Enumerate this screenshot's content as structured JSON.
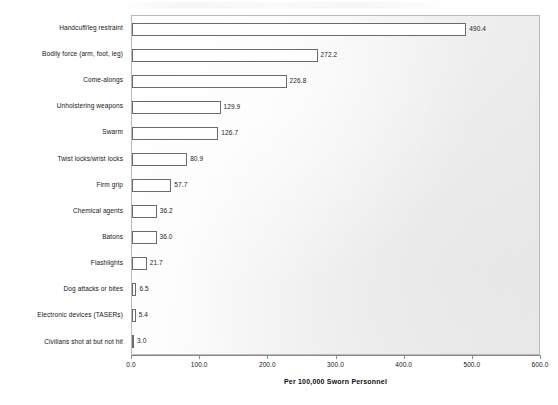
{
  "chart_data": {
    "type": "bar",
    "orientation": "horizontal",
    "title": "",
    "xlabel": "Per 100,000 Sworn Personnel",
    "ylabel": "",
    "xlim": [
      0.0,
      600.0
    ],
    "xticks": [
      "0.0",
      "100.0",
      "200.0",
      "300.0",
      "400.0",
      "500.0",
      "600.0"
    ],
    "xtick_values": [
      0,
      100,
      200,
      300,
      400,
      500,
      600
    ],
    "grid": false,
    "legend": null,
    "categories": [
      "Handcuff/leg restraint",
      "Bodily force (arm, foot, leg)",
      "Come-alongs",
      "Unholstering weapons",
      "Swarm",
      "Twist locks/wrist locks",
      "Firm grip",
      "Chemical agents",
      "Batons",
      "Flashlights",
      "Dog attacks or bites",
      "Electronic devices (TASERs)",
      "Civilians shot at but not hit"
    ],
    "values": [
      490.4,
      272.2,
      226.8,
      129.9,
      126.7,
      80.9,
      57.7,
      36.2,
      36.0,
      21.7,
      6.5,
      5.4,
      3.0
    ],
    "value_labels": [
      "490.4",
      "272.2",
      "226.8",
      "129.9",
      "126.7",
      "80.9",
      "57.7",
      "36.2",
      "36.0",
      "21.7",
      "6.5",
      "5.4",
      "3.0"
    ],
    "bar_fill_color": "#ffffff",
    "bar_edge_color": "#6a6a6a",
    "plot_background_color": "#f2f2f2",
    "text_color": "#141414"
  }
}
